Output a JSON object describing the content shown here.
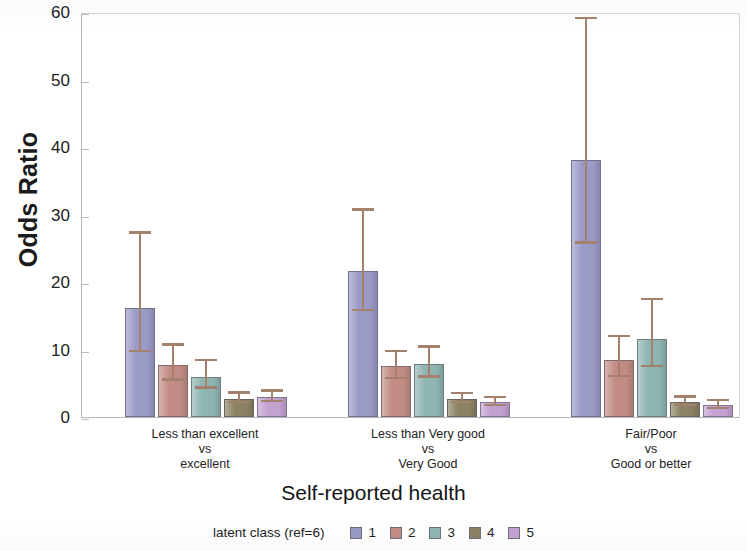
{
  "chart_data": {
    "type": "bar",
    "title": "",
    "xlabel": "Self-reported health",
    "ylabel": "Odds Ratio",
    "ylim": [
      0,
      60
    ],
    "yticks": [
      0,
      10,
      20,
      30,
      40,
      50,
      60
    ],
    "grid": false,
    "legend_position": "bottom",
    "legend_title": "latent class (ref=6)",
    "categories": [
      "Less than excellent\nvs\nexcellent",
      "Less than Very good\nvs\nVery Good",
      "Fair/Poor\nvs\nGood or better"
    ],
    "category_lines": [
      [
        "Less than excellent",
        "vs",
        "excellent"
      ],
      [
        "Less than Very good",
        "vs",
        "Very Good"
      ],
      [
        "Fair/Poor",
        "vs",
        "Good or better"
      ]
    ],
    "series": [
      {
        "name": "1",
        "color": "#9a9ac7",
        "values": [
          16.1,
          21.6,
          38.1
        ],
        "ci_low": [
          9.6,
          15.7,
          25.7
        ],
        "ci_high": [
          27.5,
          30.9,
          59.3
        ]
      },
      {
        "name": "2",
        "color": "#c28c85",
        "values": [
          7.7,
          7.6,
          8.5
        ],
        "ci_low": [
          5.4,
          5.6,
          5.9
        ],
        "ci_high": [
          10.9,
          10.0,
          12.2
        ]
      },
      {
        "name": "3",
        "color": "#8fb5b1",
        "values": [
          6.0,
          7.9,
          11.5
        ],
        "ci_low": [
          4.2,
          5.8,
          7.4
        ],
        "ci_high": [
          8.6,
          10.6,
          17.7
        ]
      },
      {
        "name": "4",
        "color": "#8b8265",
        "values": [
          2.7,
          2.7,
          2.2
        ],
        "ci_low": [
          2.0,
          2.0,
          1.6
        ],
        "ci_high": [
          3.8,
          3.7,
          3.2
        ]
      },
      {
        "name": "5",
        "color": "#c3a1d1",
        "values": [
          3.0,
          2.2,
          1.8
        ],
        "ci_low": [
          2.2,
          1.6,
          1.2
        ],
        "ci_high": [
          4.1,
          3.1,
          2.7
        ]
      }
    ]
  },
  "legend": {
    "title": "latent class (ref=6)",
    "items": [
      {
        "label": "1",
        "color": "#9a9ac7"
      },
      {
        "label": "2",
        "color": "#c28c85"
      },
      {
        "label": "3",
        "color": "#8fb5b1"
      },
      {
        "label": "4",
        "color": "#8b8265"
      },
      {
        "label": "5",
        "color": "#c3a1d1"
      }
    ]
  },
  "axes": {
    "y_title": "Odds Ratio",
    "x_title": "Self-reported health",
    "y_tick_labels": [
      "0",
      "10",
      "20",
      "30",
      "40",
      "50",
      "60"
    ]
  }
}
